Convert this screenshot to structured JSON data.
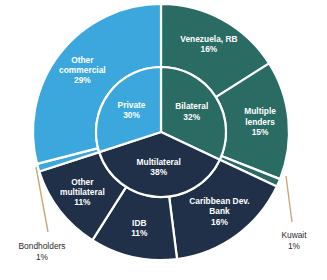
{
  "chart_data": {
    "type": "pie",
    "title": "",
    "subtitle": "",
    "xlabel": "",
    "ylabel": "",
    "legend_position": "none",
    "grid": false,
    "variant": "two-ring sunburst (nested donut)",
    "center": {
      "x": 161,
      "y": 132
    },
    "inner_radius": 65,
    "outer_radius": 128,
    "start_angle_deg": 0,
    "direction": "clockwise",
    "colors": {
      "private": "#3BA7DC",
      "bilateral": "#2A6B63",
      "multilateral": "#1F3048",
      "slice_border": "#FFFFFF",
      "leader_line": "#C8A878",
      "label_text_inside": "#FFFFFF",
      "callout_text": "#2A2A2A",
      "background": "#FFFFFF"
    },
    "inner_ring": {
      "name": "Creditor group",
      "categories": [
        "Private",
        "Bilateral",
        "Multilateral"
      ],
      "values": [
        30,
        32,
        38
      ],
      "labels": [
        {
          "name": "Private",
          "value": 30,
          "label_line1": "Private",
          "label_line2": "30%",
          "color": "#3BA7DC"
        },
        {
          "name": "Bilateral",
          "value": 32,
          "label_line1": "Bilateral",
          "label_line2": "32%",
          "color": "#2A6B63"
        },
        {
          "name": "Multilateral",
          "value": 38,
          "label_line1": "Multilateral",
          "label_line2": "38%",
          "color": "#1F3048"
        }
      ]
    },
    "outer_ring": {
      "name": "Creditor",
      "categories": [
        "Venezuela, RB",
        "Multiple lenders",
        "Kuwait",
        "Caribbean Dev. Bank",
        "IDB",
        "Other multilateral",
        "Bondholders",
        "Other commercial"
      ],
      "values": [
        16,
        15,
        1,
        16,
        11,
        11,
        1,
        29
      ],
      "labels": [
        {
          "name": "Venezuela, RB",
          "value": 16,
          "label_lines": [
            "Venezuela, RB",
            "16%"
          ],
          "parent": "Bilateral",
          "color": "#2A6B63",
          "placement": "inside"
        },
        {
          "name": "Multiple lenders",
          "value": 15,
          "label_lines": [
            "Multiple",
            "lenders",
            "15%"
          ],
          "parent": "Bilateral",
          "color": "#2A6B63",
          "placement": "inside"
        },
        {
          "name": "Kuwait",
          "value": 1,
          "label_lines": [
            "Kuwait",
            "1%"
          ],
          "parent": "Bilateral",
          "color": "#2A6B63",
          "placement": "callout"
        },
        {
          "name": "Caribbean Dev. Bank",
          "value": 16,
          "label_lines": [
            "Caribbean Dev.",
            "Bank",
            "16%"
          ],
          "parent": "Multilateral",
          "color": "#1F3048",
          "placement": "inside"
        },
        {
          "name": "IDB",
          "value": 11,
          "label_lines": [
            "IDB",
            "11%"
          ],
          "parent": "Multilateral",
          "color": "#1F3048",
          "placement": "inside"
        },
        {
          "name": "Other multilateral",
          "value": 11,
          "label_lines": [
            "Other",
            "multilateral",
            "11%"
          ],
          "parent": "Multilateral",
          "color": "#1F3048",
          "placement": "inside"
        },
        {
          "name": "Bondholders",
          "value": 1,
          "label_lines": [
            "Bondholders",
            "1%"
          ],
          "parent": "Private",
          "color": "#3BA7DC",
          "placement": "callout"
        },
        {
          "name": "Other commercial",
          "value": 29,
          "label_lines": [
            "Other",
            "commercial",
            "29%"
          ],
          "parent": "Private",
          "color": "#3BA7DC",
          "placement": "inside"
        }
      ]
    },
    "callouts": [
      {
        "name": "Bondholders",
        "line1": "Bondholders",
        "line2": "1%",
        "text_x": 42,
        "text_y": 247,
        "leader_x1": 36,
        "leader_y1": 167,
        "leader_x2": 48,
        "leader_y2": 232
      },
      {
        "name": "Kuwait",
        "line1": "Kuwait",
        "line2": "1%",
        "text_x": 294,
        "text_y": 236,
        "leader_x1": 286,
        "leader_y1": 176,
        "leader_x2": 292,
        "leader_y2": 222
      }
    ]
  }
}
